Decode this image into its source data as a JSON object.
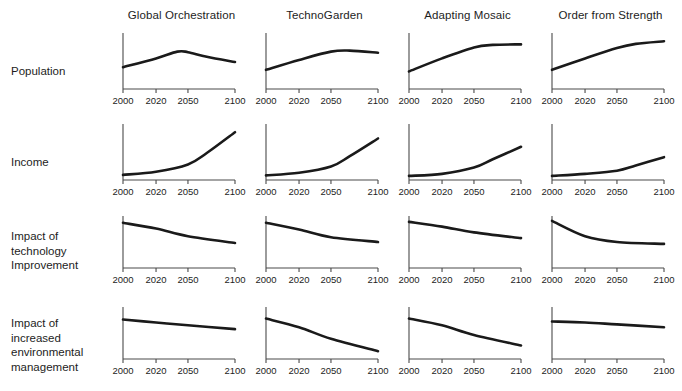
{
  "figure": {
    "title": "",
    "background_color": "#ffffff",
    "line_color": "#1a1a1a",
    "axis_color": "#4a4a4a",
    "text_color": "#1d1d1d"
  },
  "columns": [
    {
      "label": "Global Orchestration"
    },
    {
      "label": "TechnoGarden"
    },
    {
      "label": "Adapting Mosaic"
    },
    {
      "label": "Order from Strength"
    }
  ],
  "rows": [
    {
      "label": "Population"
    },
    {
      "label": "Income"
    },
    {
      "label": "Impact of\ntechnology\nImprovement"
    },
    {
      "label": "Impact of\nincreased\nenvironmental\nmanagement"
    }
  ],
  "axis": {
    "xticks": [
      2000,
      2020,
      2050,
      2100
    ],
    "xtick_labels": [
      "2000",
      "2020",
      "2050",
      "2100"
    ],
    "xlim": [
      2000,
      2100
    ],
    "ylim": [
      0,
      1
    ],
    "yticks": [],
    "ytick_labels": []
  },
  "chart_data": {
    "type": "line",
    "xlabel": "",
    "ylabel": "",
    "xlim": [
      2000,
      2100
    ],
    "ylim": [
      0,
      1
    ],
    "grid": false,
    "legend_position": "none",
    "x": [
      2000,
      2020,
      2050,
      2100
    ],
    "columns": [
      "Global Orchestration",
      "TechnoGarden",
      "Adapting Mosaic",
      "Order from Strength"
    ],
    "rows": [
      "Population",
      "Income",
      "Impact of technology Improvement",
      "Impact of increased environmental management"
    ],
    "panels": [
      {
        "row": "Population",
        "column": "Global Orchestration",
        "series": [
          {
            "name": "Population",
            "x": [
              2000,
              2020,
              2040,
              2050,
              2070,
              2100
            ],
            "values": [
              0.38,
              0.55,
              0.68,
              0.67,
              0.58,
              0.48
            ]
          }
        ]
      },
      {
        "row": "Population",
        "column": "TechnoGarden",
        "series": [
          {
            "name": "Population",
            "x": [
              2000,
              2020,
              2050,
              2070,
              2100
            ],
            "values": [
              0.33,
              0.52,
              0.68,
              0.7,
              0.66
            ]
          }
        ]
      },
      {
        "row": "Population",
        "column": "Adapting Mosaic",
        "series": [
          {
            "name": "Population",
            "x": [
              2000,
              2020,
              2050,
              2070,
              2100
            ],
            "values": [
              0.3,
              0.55,
              0.76,
              0.81,
              0.82
            ]
          }
        ]
      },
      {
        "row": "Population",
        "column": "Order from Strength",
        "series": [
          {
            "name": "Population",
            "x": [
              2000,
              2020,
              2050,
              2070,
              2100
            ],
            "values": [
              0.33,
              0.55,
              0.75,
              0.83,
              0.88
            ]
          }
        ]
      },
      {
        "row": "Income",
        "column": "Global Orchestration",
        "series": [
          {
            "name": "Income",
            "x": [
              2000,
              2020,
              2050,
              2070,
              2100
            ],
            "values": [
              0.06,
              0.12,
              0.26,
              0.48,
              0.88
            ]
          }
        ]
      },
      {
        "row": "Income",
        "column": "TechnoGarden",
        "series": [
          {
            "name": "Income",
            "x": [
              2000,
              2020,
              2050,
              2070,
              2100
            ],
            "values": [
              0.05,
              0.1,
              0.22,
              0.42,
              0.76
            ]
          }
        ]
      },
      {
        "row": "Income",
        "column": "Adapting Mosaic",
        "series": [
          {
            "name": "Income",
            "x": [
              2000,
              2020,
              2050,
              2070,
              2100
            ],
            "values": [
              0.04,
              0.08,
              0.2,
              0.36,
              0.6
            ]
          }
        ]
      },
      {
        "row": "Income",
        "column": "Order from Strength",
        "series": [
          {
            "name": "Income",
            "x": [
              2000,
              2020,
              2050,
              2070,
              2100
            ],
            "values": [
              0.04,
              0.08,
              0.14,
              0.24,
              0.4
            ]
          }
        ]
      },
      {
        "row": "Impact of technology Improvement",
        "column": "Global Orchestration",
        "series": [
          {
            "name": "Impact",
            "x": [
              2000,
              2020,
              2050,
              2100
            ],
            "values": [
              0.9,
              0.78,
              0.62,
              0.48
            ]
          }
        ]
      },
      {
        "row": "Impact of technology Improvement",
        "column": "TechnoGarden",
        "series": [
          {
            "name": "Impact",
            "x": [
              2000,
              2020,
              2050,
              2100
            ],
            "values": [
              0.9,
              0.76,
              0.6,
              0.5
            ]
          }
        ]
      },
      {
        "row": "Impact of technology Improvement",
        "column": "Adapting Mosaic",
        "series": [
          {
            "name": "Impact",
            "x": [
              2000,
              2020,
              2050,
              2100
            ],
            "values": [
              0.92,
              0.82,
              0.7,
              0.58
            ]
          }
        ]
      },
      {
        "row": "Impact of technology Improvement",
        "column": "Order from Strength",
        "series": [
          {
            "name": "Impact",
            "x": [
              2000,
              2020,
              2050,
              2100
            ],
            "values": [
              0.94,
              0.62,
              0.5,
              0.46
            ]
          }
        ]
      },
      {
        "row": "Impact of increased environmental management",
        "column": "Global Orchestration",
        "series": [
          {
            "name": "Impact",
            "x": [
              2000,
              2020,
              2050,
              2100
            ],
            "values": [
              0.78,
              0.72,
              0.66,
              0.58
            ]
          }
        ]
      },
      {
        "row": "Impact of increased environmental management",
        "column": "TechnoGarden",
        "series": [
          {
            "name": "Impact",
            "x": [
              2000,
              2020,
              2050,
              2100
            ],
            "values": [
              0.8,
              0.62,
              0.38,
              0.12
            ]
          }
        ]
      },
      {
        "row": "Impact of increased environmental management",
        "column": "Adapting Mosaic",
        "series": [
          {
            "name": "Impact",
            "x": [
              2000,
              2020,
              2050,
              2100
            ],
            "values": [
              0.8,
              0.66,
              0.46,
              0.24
            ]
          }
        ]
      },
      {
        "row": "Impact of increased environmental management",
        "column": "Order from Strength",
        "series": [
          {
            "name": "Impact",
            "x": [
              2000,
              2020,
              2050,
              2100
            ],
            "values": [
              0.74,
              0.72,
              0.68,
              0.62
            ]
          }
        ]
      }
    ]
  }
}
